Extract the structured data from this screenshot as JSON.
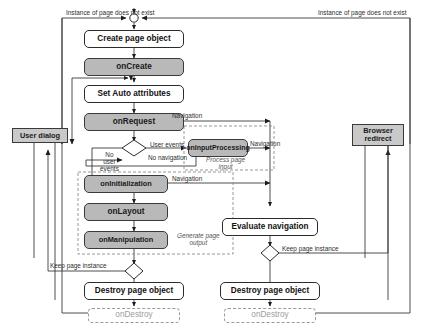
{
  "diagram": {
    "colors": {
      "handler_fill": "#b9b9b9",
      "external_fill": "#c9c9c9",
      "action_fill": "#ffffff",
      "ghost_stroke": "#9a9a9a",
      "line": "#2b2b2b"
    },
    "nodes": {
      "create_page_object": "Create page object",
      "on_create": "onCreate",
      "set_auto_attributes": "Set Auto attributes",
      "on_request": "onRequest",
      "on_input_processing": "onInputProcessing",
      "on_initialization": "onInitialization",
      "on_layout": "onLayout",
      "on_manipulation": "onManipulation",
      "user_dialog": "User dialog",
      "browser_redirect": "Browser\nredirect",
      "evaluate_navigation": "Evaluate navigation",
      "destroy_page_object_left": "Destroy page object",
      "destroy_page_object_right": "Destroy page object",
      "on_destroy_left": "onDestroy",
      "on_destroy_right": "onDestroy"
    },
    "edge_labels": {
      "instance_not_exist_left": "Instance of page does not exist",
      "instance_not_exist_right": "Instance of page does not exist",
      "navigation_request": "Navigation",
      "user_events": "User events",
      "no_navigation": "No navigation",
      "no_user_events": "No\nuser\nevents",
      "navigation_input": "Navigation",
      "navigation_init": "Navigation",
      "keep_page_instance_left": "Keep page instance",
      "keep_page_instance_right": "Keep page instance"
    },
    "group_labels": {
      "process_page_input": "Process page\ninput",
      "generate_page_output": "Generate page\noutput"
    }
  }
}
